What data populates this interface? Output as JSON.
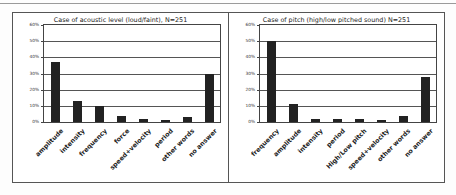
{
  "chart_data": [
    {
      "type": "bar",
      "title": "Case of acoustic level (loud/faint), N=251",
      "categories": [
        "amplitude",
        "intensity",
        "frequency",
        "force",
        "speed+velocity",
        "period",
        "other words",
        "no answer"
      ],
      "values": [
        37,
        13,
        10,
        4,
        2,
        1,
        3,
        30
      ],
      "xlabel": "",
      "ylabel": "",
      "ylim": [
        0,
        60
      ],
      "yticks": [
        "0%",
        "10%",
        "20%",
        "30%",
        "40%",
        "50%",
        "60%"
      ],
      "grid": true,
      "bar_color": "#222222"
    },
    {
      "type": "bar",
      "title": "Case of  pitch (high/low pitched sound) N=251",
      "categories": [
        "frequency",
        "amplitude",
        "intensity",
        "period",
        "High/Low pitch",
        "speed+velocity",
        "other words",
        "no answer"
      ],
      "values": [
        50,
        11,
        2,
        2,
        2,
        1,
        4,
        28
      ],
      "xlabel": "",
      "ylabel": "",
      "ylim": [
        0,
        60
      ],
      "yticks": [
        "0%",
        "10%",
        "20%",
        "30%",
        "40%",
        "50%",
        "60%"
      ],
      "grid": true,
      "bar_color": "#222222"
    }
  ]
}
